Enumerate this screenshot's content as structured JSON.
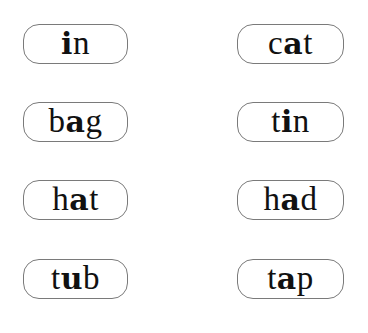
{
  "worksheet": {
    "emphasis": "vowel in bold",
    "cards": [
      {
        "id": "in",
        "word": "in",
        "parts": [
          "",
          "i",
          "n"
        ],
        "column": "left",
        "row": 1
      },
      {
        "id": "cat",
        "word": "cat",
        "parts": [
          "c",
          "a",
          "t"
        ],
        "column": "right",
        "row": 1
      },
      {
        "id": "bag",
        "word": "bag",
        "parts": [
          "b",
          "a",
          "g"
        ],
        "column": "left",
        "row": 2
      },
      {
        "id": "tin",
        "word": "tin",
        "parts": [
          "t",
          "i",
          "n"
        ],
        "column": "right",
        "row": 2
      },
      {
        "id": "hat",
        "word": "hat",
        "parts": [
          "h",
          "a",
          "t"
        ],
        "column": "left",
        "row": 3
      },
      {
        "id": "had",
        "word": "had",
        "parts": [
          "h",
          "a",
          "d"
        ],
        "column": "right",
        "row": 3
      },
      {
        "id": "tub",
        "word": "tub",
        "parts": [
          "t",
          "u",
          "b"
        ],
        "column": "left",
        "row": 4
      },
      {
        "id": "tap",
        "word": "tap",
        "parts": [
          "t",
          "a",
          "p"
        ],
        "column": "right",
        "row": 4
      }
    ]
  },
  "colors": {
    "text": "#111111",
    "border": "#7a7a7a",
    "background": "#ffffff"
  }
}
